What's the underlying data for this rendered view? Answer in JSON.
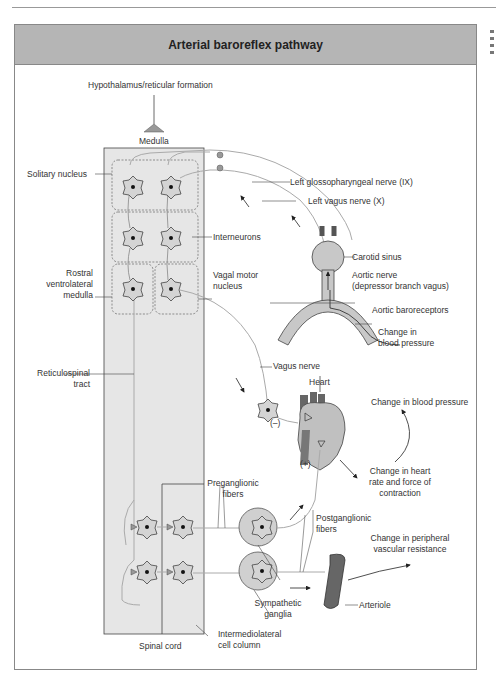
{
  "title": "Arterial baroreflex pathway",
  "colors": {
    "title_bar": "#b5b5b5",
    "cord_fill": "#e6e6e6",
    "neuron_fill": "#d4d4d4",
    "vessel_fill": "#c8c8c8",
    "line": "#444444",
    "nerve": "#aaaaaa"
  },
  "labels": {
    "hypothalamus": "Hypothalamus/reticular formation",
    "medulla": "Medulla",
    "solitary_nucleus": "Solitary nucleus",
    "left_glossopharyngeal": "Left glossopharyngeal nerve (IX)",
    "left_vagus": "Left vagus nerve (X)",
    "interneurons": "Interneurons",
    "carotid_sinus": "Carotid sinus",
    "rostral_1": "Rostral",
    "rostral_2": "ventrolateral",
    "rostral_3": "medulla",
    "vagal_motor_1": "Vagal motor",
    "vagal_motor_2": "nucleus",
    "aortic_nerve_1": "Aortic nerve",
    "aortic_nerve_2": "(depressor branch vagus)",
    "aortic_baroreceptors": "Aortic baroreceptors",
    "change_bp_1": "Change in",
    "change_bp_2": "blood pressure",
    "reticulospinal_1": "Reticulospinal",
    "reticulospinal_2": "tract",
    "vagus_nerve": "Vagus nerve",
    "heart": "Heart",
    "minus": "(–)",
    "plus": "(+)",
    "change_blood_pressure": "Change in blood pressure",
    "change_hr_1": "Change in heart",
    "change_hr_2": "rate and force of",
    "change_hr_3": "contraction",
    "preganglionic_1": "Preganglionic",
    "preganglionic_2": "fibers",
    "postganglionic_1": "Postganglionic",
    "postganglionic_2": "fibers",
    "change_pvr_1": "Change in peripheral",
    "change_pvr_2": "vascular resistance",
    "arteriole": "Arteriole",
    "sympathetic_1": "Sympathetic",
    "sympathetic_2": "ganglia",
    "spinal_cord": "Spinal cord",
    "iml_1": "Intermediolateral",
    "iml_2": "cell column"
  }
}
